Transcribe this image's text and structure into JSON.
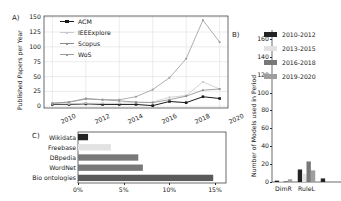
{
  "figure": {
    "panel_a_label": "A)",
    "panel_b_label": "B)",
    "panel_c_label": "C)"
  },
  "colors": {
    "series_acm": "#1a1a1a",
    "series_ieee": "#c9c9c9",
    "series_scopus": "#8c8c8c",
    "series_wos": "#9a9a9a",
    "bar_2010_2012": "#232323",
    "bar_2013_2015": "#e2e2e2",
    "bar_2016_2018": "#787878",
    "bar_2019_2020": "#9e9e9e",
    "bar_c_wikidata": "#232323",
    "bar_c_freebase": "#e2e2e2",
    "bar_c_dbpedia": "#787878",
    "bar_c_wordnet": "#787878",
    "bar_c_bio": "#5a5a5a",
    "axis": "#2b2b2b",
    "grid": "#d9d9d9"
  },
  "chart_data": [
    {
      "id": "panel-a",
      "type": "line",
      "title": "",
      "xlabel": "",
      "ylabel": "Published Papers per Year",
      "x": [
        2010,
        2011,
        2012,
        2013,
        2014,
        2015,
        2016,
        2017,
        2018,
        2019,
        2020
      ],
      "xticks": [
        "2010",
        "2012",
        "2014",
        "2016",
        "2018",
        "2020"
      ],
      "xtickvals": [
        2010,
        2012,
        2014,
        2016,
        2018,
        2020
      ],
      "yticks": [
        "0",
        "25",
        "50",
        "75",
        "100",
        "125",
        "150"
      ],
      "ytickvals": [
        0,
        25,
        50,
        75,
        100,
        125,
        150
      ],
      "xlim": [
        2009.5,
        2020.5
      ],
      "ylim": [
        -3,
        152
      ],
      "grid": true,
      "legend_position": "upper-left",
      "series": [
        {
          "name": "ACM",
          "marker": "square",
          "values": [
            3,
            3,
            4,
            3,
            3,
            3,
            1,
            8,
            6,
            16,
            13
          ]
        },
        {
          "name": "IEEExplore",
          "marker": "none",
          "values": [
            4,
            4,
            5,
            5,
            5,
            6,
            7,
            15,
            18,
            41,
            29
          ]
        },
        {
          "name": "Scopus",
          "marker": "none",
          "values": [
            5,
            7,
            13,
            11,
            9,
            7,
            6,
            11,
            17,
            27,
            29
          ]
        },
        {
          "name": "WoS",
          "marker": "none",
          "values": [
            5,
            7,
            12,
            11,
            11,
            16,
            28,
            48,
            80,
            145,
            108
          ]
        }
      ]
    },
    {
      "id": "panel-b",
      "type": "bar",
      "title": "",
      "xlabel": "",
      "ylabel": "Number of Models used in Period",
      "categories": [
        "DimR",
        "RuleL",
        ""
      ],
      "yticks": [
        "0",
        "20",
        "40",
        "60",
        "80",
        "100",
        "120",
        "140",
        "160"
      ],
      "ytickvals": [
        0,
        20,
        40,
        60,
        80,
        100,
        120,
        140,
        160
      ],
      "ylim": [
        0,
        170
      ],
      "grid": false,
      "legend_position": "upper-right",
      "series": [
        {
          "name": "2010-2012",
          "values": [
            1.5,
            14,
            4
          ]
        },
        {
          "name": "2013-2015",
          "values": [
            1.0,
            9,
            0
          ]
        },
        {
          "name": "2016-2018",
          "values": [
            1.0,
            23,
            0
          ]
        },
        {
          "name": "2019-2020",
          "values": [
            3.0,
            13,
            0
          ]
        }
      ]
    },
    {
      "id": "panel-c",
      "type": "bar",
      "orientation": "horizontal",
      "title": "",
      "xlabel": "",
      "ylabel": "",
      "categories": [
        "Wikidata",
        "Freebase",
        "DBpedia",
        "WordNet",
        "Bio ontologies"
      ],
      "values": [
        1.1,
        3.6,
        6.6,
        7.1,
        14.8
      ],
      "xticks": [
        "0%",
        "5%",
        "10%",
        "15%"
      ],
      "xtickvals": [
        0,
        5,
        10,
        15
      ],
      "xlim": [
        0,
        16.2
      ],
      "grid": false,
      "legend_position": "none"
    }
  ]
}
